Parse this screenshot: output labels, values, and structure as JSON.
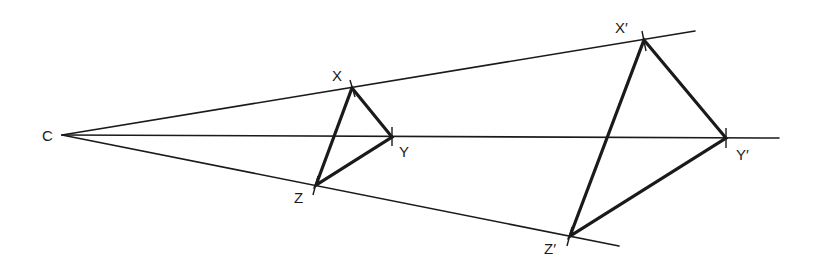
{
  "diagram": {
    "title": "",
    "colors": {
      "background": "#ffffff",
      "stroke": "#1a1a1a"
    },
    "centre": {
      "id": "C",
      "label": "C",
      "x": 62,
      "y": 135,
      "label_x": 42,
      "label_y": 141
    },
    "rays": [
      {
        "id": "ray-through-x",
        "from": "C",
        "x1": 62,
        "y1": 135,
        "x2": 695,
        "y2": 31
      },
      {
        "id": "ray-through-y",
        "from": "C",
        "x1": 62,
        "y1": 135,
        "x2": 779,
        "y2": 138
      },
      {
        "id": "ray-through-z",
        "from": "C",
        "x1": 62,
        "y1": 135,
        "x2": 619,
        "y2": 246
      }
    ],
    "object_triangle": {
      "name": "XYZ",
      "vertices": [
        {
          "id": "X",
          "label": "X",
          "x": 352,
          "y": 88,
          "label_x": 332,
          "label_y": 81
        },
        {
          "id": "Y",
          "label": "Y",
          "x": 392,
          "y": 137,
          "label_x": 399,
          "label_y": 157
        },
        {
          "id": "Z",
          "label": "Z",
          "x": 316,
          "y": 185,
          "label_x": 294,
          "label_y": 203
        }
      ]
    },
    "image_triangle": {
      "name": "X'Y'Z'",
      "vertices": [
        {
          "id": "X'",
          "label": "X′",
          "x": 644,
          "y": 40,
          "label_x": 615,
          "label_y": 33
        },
        {
          "id": "Y'",
          "label": "Y′",
          "x": 726,
          "y": 138,
          "label_x": 736,
          "label_y": 160
        },
        {
          "id": "Z'",
          "label": "Z′",
          "x": 570,
          "y": 236,
          "label_x": 544,
          "label_y": 254
        }
      ]
    },
    "tick_marks": [
      {
        "at": "X",
        "x1": 350,
        "y1": 80,
        "x2": 355,
        "y2": 97
      },
      {
        "at": "Y",
        "x1": 392,
        "y1": 127,
        "x2": 392,
        "y2": 146
      },
      {
        "at": "Z",
        "x1": 318,
        "y1": 176,
        "x2": 313,
        "y2": 195
      },
      {
        "at": "X'",
        "x1": 642,
        "y1": 31,
        "x2": 646,
        "y2": 51
      },
      {
        "at": "Y'",
        "x1": 726,
        "y1": 128,
        "x2": 726,
        "y2": 148
      },
      {
        "at": "Z'",
        "x1": 572,
        "y1": 227,
        "x2": 567,
        "y2": 246
      }
    ]
  }
}
